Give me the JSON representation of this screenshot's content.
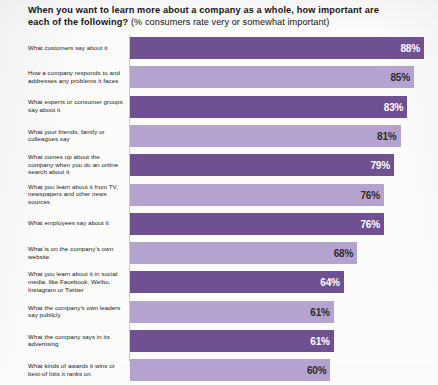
{
  "heading": {
    "line1": "When you want to learn more about a company as a whole, how important are",
    "line2": "each of the following?",
    "subtitle": "(% consumers rate very or somewhat important)"
  },
  "colors": {
    "bar_dark": "#6f5091",
    "bar_light": "#b5a3cf",
    "background": "#fcfcfb",
    "text": "#191919",
    "axis": "#c9c9cf"
  },
  "chart_data": {
    "type": "bar",
    "orientation": "horizontal",
    "title": "When you want to learn more about a company as a whole, how important are each of the following?",
    "subtitle": "(% consumers rate very or somewhat important)",
    "xlabel": "",
    "ylabel": "",
    "xlim": [
      0,
      100
    ],
    "grid": false,
    "legend": false,
    "value_suffix": "%",
    "categories": [
      "What customers say about it",
      "How a company responds to and addresses any problems it faces",
      "What experts or consumer groups say about it",
      "What your friends, family or colleagues say",
      "What comes up about the company when you do an online search about it",
      "What you learn about it from TV, newspapers and other news sources",
      "What employees say about it",
      "What is on the company's own website",
      "What you learn about it in social media, like Facebook, Weibo, Instagram or Twitter",
      "What the company's own leaders say publicly",
      "What the company says in its advertising",
      "What kinds of awards it wins or best-of lists it ranks on"
    ],
    "values": [
      88,
      85,
      83,
      81,
      79,
      76,
      76,
      68,
      64,
      61,
      61,
      60
    ],
    "value_labels": [
      "88%",
      "85%",
      "83%",
      "81%",
      "79%",
      "76%",
      "76%",
      "68%",
      "64%",
      "61%",
      "61%",
      "60%"
    ],
    "bar_shades": [
      "dark",
      "light",
      "dark",
      "light",
      "dark",
      "light",
      "dark",
      "light",
      "dark",
      "light",
      "dark",
      "light"
    ]
  }
}
